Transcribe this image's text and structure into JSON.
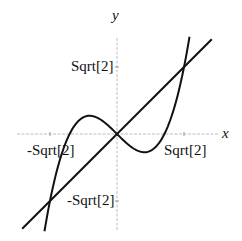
{
  "chart_data": {
    "type": "line",
    "title": "",
    "xlabel": "x",
    "ylabel": "y",
    "xticks": [
      {
        "value": -1.41421,
        "label": "-Sqrt[2]"
      },
      {
        "value": 1.41421,
        "label": "Sqrt[2]"
      }
    ],
    "yticks": [
      {
        "value": 1.41421,
        "label": "Sqrt[2]"
      },
      {
        "value": -1.41421,
        "label": "-Sqrt[2]"
      }
    ],
    "xlim": [
      -2.1,
      2.1
    ],
    "ylim": [
      -2.0,
      2.0
    ],
    "grid": false,
    "series": [
      {
        "name": "y = x^3 - x",
        "expression": "x^3 - x",
        "x_range": [
          -1.53,
          1.53
        ]
      },
      {
        "name": "y = x",
        "expression": "x",
        "x_range": [
          -2.0,
          2.0
        ]
      }
    ],
    "intersections": [
      {
        "x": -1.41421,
        "y": -1.41421
      },
      {
        "x": 0,
        "y": 0
      },
      {
        "x": 1.41421,
        "y": 1.41421
      }
    ],
    "colors": {
      "curve": "#111111",
      "axes": "#bbbbbb"
    }
  },
  "labels": {
    "x_axis": "x",
    "y_axis": "y",
    "x_tick_neg": "-Sqrt[2]",
    "x_tick_pos": "Sqrt[2]",
    "y_tick_pos": "Sqrt[2]",
    "y_tick_neg": "-Sqrt[2]"
  }
}
